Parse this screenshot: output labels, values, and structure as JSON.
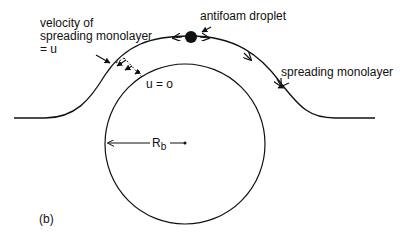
{
  "figure": {
    "panel_label": "(b)",
    "labels": {
      "velocity_line1": "velocity of",
      "velocity_line2": "spreading monolayer",
      "velocity_line3": "= u",
      "antifoam": "antifoam droplet",
      "spreading": "spreading monolayer",
      "u_zero": "u = o",
      "radius": "R",
      "radius_sub": "b"
    },
    "colors": {
      "stroke": "#111111",
      "background": "#ffffff"
    }
  }
}
